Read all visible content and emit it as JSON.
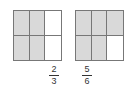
{
  "figures": [
    {
      "label": "two-thirds",
      "cells": [
        true,
        true,
        false,
        true,
        true,
        false
      ],
      "fraction": {
        "numerator": "2",
        "denominator": "3"
      }
    },
    {
      "label": "five-sixths",
      "cells": [
        true,
        true,
        true,
        true,
        true,
        false
      ],
      "fraction": {
        "numerator": "5",
        "denominator": "6"
      }
    }
  ],
  "colors": {
    "shaded": "#d9d9d9",
    "unshaded": "#ffffff",
    "border": "#777777"
  }
}
